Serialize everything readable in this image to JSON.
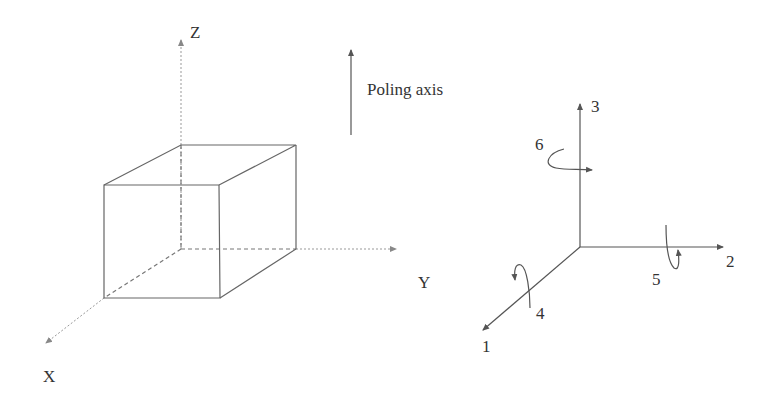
{
  "diagram": {
    "left": {
      "axes": {
        "z": "Z",
        "y": "Y",
        "x": "X"
      },
      "object": "cube"
    },
    "poling": {
      "label": "Poling axis"
    },
    "right": {
      "axes": {
        "a3": "3",
        "a2": "2",
        "a1": "1"
      },
      "rotations": {
        "r4": "4",
        "r5": "5",
        "r6": "6"
      }
    },
    "colors": {
      "line": "#555555",
      "dashed": "#777777",
      "text": "#333333"
    }
  }
}
